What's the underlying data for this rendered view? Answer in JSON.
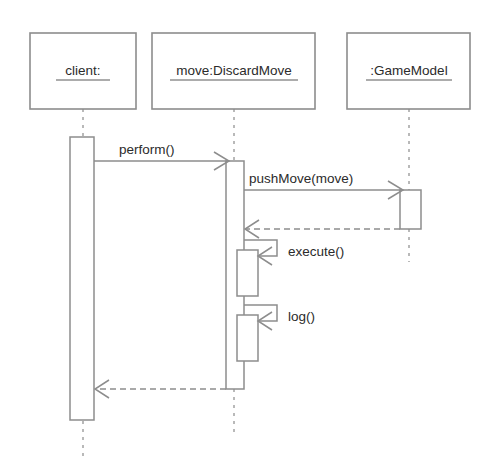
{
  "diagram": {
    "kind": "uml-sequence-diagram",
    "title": "",
    "canvas": {
      "width": 502,
      "height": 465
    },
    "colors": {
      "background": "#ffffff",
      "stroke": "#8d8d8d",
      "lifeline_stroke": "#a8a8a8",
      "text": "#2b2b2b"
    },
    "participants": [
      {
        "id": "client",
        "label": "client:",
        "underlined": true,
        "box": {
          "x": 30,
          "y": 33,
          "w": 106,
          "h": 76
        },
        "lifeline_x": 83,
        "lifeline_top": 109,
        "lifeline_bottom": 456
      },
      {
        "id": "move",
        "label": "move:DiscardMove",
        "underlined": true,
        "box": {
          "x": 152,
          "y": 33,
          "w": 163,
          "h": 76
        },
        "lifeline_x": 234,
        "lifeline_top": 109,
        "lifeline_bottom": 432
      },
      {
        "id": "gamemodel",
        "label": ":GameModel",
        "underlined": true,
        "box": {
          "x": 347,
          "y": 33,
          "w": 123,
          "h": 76
        },
        "lifeline_x": 409,
        "lifeline_top": 109,
        "lifeline_bottom": 262
      }
    ],
    "activations": [
      {
        "id": "act-client",
        "participant": "client",
        "x": 70,
        "y": 137,
        "w": 24,
        "h": 283
      },
      {
        "id": "act-move-main",
        "participant": "move",
        "x": 226,
        "y": 161,
        "w": 18,
        "h": 228
      },
      {
        "id": "act-move-execute",
        "participant": "move",
        "x": 237,
        "y": 250,
        "w": 21,
        "h": 46
      },
      {
        "id": "act-move-log",
        "participant": "move",
        "x": 237,
        "y": 315,
        "w": 21,
        "h": 46
      },
      {
        "id": "act-gamemodel",
        "participant": "gamemodel",
        "x": 400,
        "y": 190,
        "w": 21,
        "h": 39
      }
    ],
    "messages": [
      {
        "id": "msg-perform",
        "label": "perform()",
        "type": "call",
        "style": "solid",
        "from": "client",
        "to": "move",
        "direction": "right",
        "y": 161,
        "label_x": 119,
        "label_y": 150
      },
      {
        "id": "msg-pushmove",
        "label": "pushMove(move)",
        "type": "call",
        "style": "solid",
        "from": "move",
        "to": "gamemodel",
        "direction": "right",
        "y": 190,
        "label_x": 249,
        "label_y": 179
      },
      {
        "id": "msg-return-gamemodel",
        "label": "",
        "type": "return",
        "style": "dashed",
        "from": "gamemodel",
        "to": "move",
        "direction": "left",
        "y": 229,
        "label_x": 0,
        "label_y": 0
      },
      {
        "id": "msg-execute",
        "label": "execute()",
        "type": "self-call",
        "style": "solid",
        "from": "move",
        "to": "move",
        "direction": "self",
        "y": 250,
        "label_x": 285,
        "label_y": 252
      },
      {
        "id": "msg-log",
        "label": "log()",
        "type": "self-call",
        "style": "solid",
        "from": "move",
        "to": "move",
        "direction": "self",
        "y": 315,
        "label_x": 285,
        "label_y": 317
      },
      {
        "id": "msg-return-client",
        "label": "",
        "type": "return",
        "style": "dashed",
        "from": "move",
        "to": "client",
        "direction": "left",
        "y": 389,
        "label_x": 0,
        "label_y": 0
      }
    ]
  }
}
